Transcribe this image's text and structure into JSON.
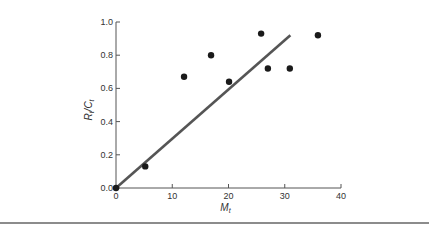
{
  "chart_data": {
    "type": "scatter",
    "title": "",
    "xlabel": {
      "main": "M",
      "sub": "t"
    },
    "ylabel": {
      "main1": "R",
      "sub1": "t",
      "sep": "/",
      "main2": "C",
      "sub2": "t"
    },
    "xlim": [
      0,
      40
    ],
    "ylim": [
      0,
      1.0
    ],
    "xticks": [
      0,
      10,
      20,
      30,
      40
    ],
    "xtick_labels": [
      "0",
      "10",
      "20",
      "30",
      "40"
    ],
    "yticks": [
      0.0,
      0.2,
      0.4,
      0.6,
      0.8,
      1.0
    ],
    "ytick_labels": [
      "0.0",
      "0.2",
      "0.4",
      "0.6",
      "0.8",
      "1.0"
    ],
    "grid": false,
    "legend": null,
    "series": [
      {
        "name": "observations",
        "kind": "scatter",
        "points": [
          {
            "x": 0,
            "y": 0.0
          },
          {
            "x": 5.2,
            "y": 0.13
          },
          {
            "x": 12.1,
            "y": 0.67
          },
          {
            "x": 16.9,
            "y": 0.8
          },
          {
            "x": 20.1,
            "y": 0.64
          },
          {
            "x": 25.8,
            "y": 0.93
          },
          {
            "x": 27.0,
            "y": 0.72
          },
          {
            "x": 30.9,
            "y": 0.72
          },
          {
            "x": 35.9,
            "y": 0.92
          }
        ]
      },
      {
        "name": "fit-line",
        "kind": "line",
        "points": [
          {
            "x": 0,
            "y": 0.0
          },
          {
            "x": 31.0,
            "y": 0.92
          }
        ]
      }
    ]
  }
}
